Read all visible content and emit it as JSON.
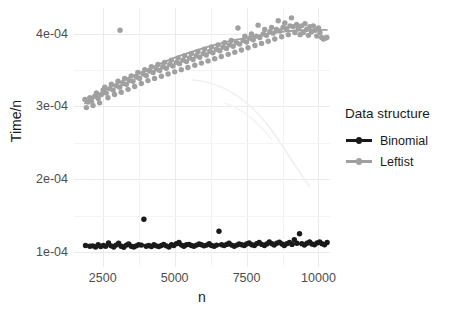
{
  "chart_data": {
    "type": "scatter",
    "title": "",
    "xlabel": "n",
    "ylabel": "Time/n",
    "xlim": [
      1500,
      10400
    ],
    "ylim": [
      8e-05,
      0.000435
    ],
    "grid": true,
    "legend_position": "right",
    "legend_title": "Data structure",
    "x_ticks": [
      {
        "value": 2500,
        "label": "2500"
      },
      {
        "value": 5000,
        "label": "5000"
      },
      {
        "value": 7500,
        "label": "7500"
      },
      {
        "value": 10000,
        "label": "10000"
      }
    ],
    "y_ticks": [
      {
        "value": 0.0001,
        "label": "1e-04"
      },
      {
        "value": 0.0002,
        "label": "2e-04"
      },
      {
        "value": 0.0003,
        "label": "3e-04"
      },
      {
        "value": 0.0004,
        "label": "4e-04"
      }
    ],
    "colors": {
      "binomial": "#1a1a1a",
      "leftist": "#a0a0a0",
      "grid": "#ebebeb",
      "panel": "#ffffff"
    },
    "series": [
      {
        "name": "Binomial",
        "color": "#1a1a1a",
        "points": [
          [
            1900,
            0.0001095
          ],
          [
            2050,
            0.0001085
          ],
          [
            2150,
            0.000109
          ],
          [
            2250,
            0.0001075
          ],
          [
            2340,
            0.0001105
          ],
          [
            2430,
            0.000108
          ],
          [
            2520,
            0.0001095
          ],
          [
            2600,
            0.0001085
          ],
          [
            2700,
            0.000113
          ],
          [
            2790,
            0.000109
          ],
          [
            2880,
            0.0001075
          ],
          [
            2960,
            0.00011
          ],
          [
            3050,
            0.0001125
          ],
          [
            3140,
            0.0001085
          ],
          [
            3230,
            0.000107
          ],
          [
            3320,
            0.00011
          ],
          [
            3400,
            0.0001115
          ],
          [
            3490,
            0.0001085
          ],
          [
            3580,
            0.0001075
          ],
          [
            3660,
            0.000109
          ],
          [
            3750,
            0.0001105
          ],
          [
            3840,
            0.00011
          ],
          [
            3930,
            0.0001455
          ],
          [
            4010,
            0.0001085
          ],
          [
            4100,
            0.0001095
          ],
          [
            4190,
            0.000108
          ],
          [
            4280,
            0.0001105
          ],
          [
            4360,
            0.000109
          ],
          [
            4450,
            0.000108
          ],
          [
            4540,
            0.0001095
          ],
          [
            4620,
            0.000111
          ],
          [
            4710,
            0.000109
          ],
          [
            4800,
            0.0001075
          ],
          [
            4890,
            0.0001105
          ],
          [
            4970,
            0.0001095
          ],
          [
            5060,
            0.000112
          ],
          [
            5150,
            0.0001135
          ],
          [
            5240,
            0.00011
          ],
          [
            5320,
            0.0001085
          ],
          [
            5410,
            0.0001105
          ],
          [
            5500,
            0.000111
          ],
          [
            5580,
            0.0001095
          ],
          [
            5670,
            0.0001085
          ],
          [
            5760,
            0.00011
          ],
          [
            5850,
            0.0001115
          ],
          [
            5930,
            0.0001105
          ],
          [
            6020,
            0.000109
          ],
          [
            6110,
            0.00011
          ],
          [
            6200,
            0.000112
          ],
          [
            6280,
            0.0001095
          ],
          [
            6370,
            0.0001085
          ],
          [
            6460,
            0.00011
          ],
          [
            6540,
            0.000129
          ],
          [
            6630,
            0.0001105
          ],
          [
            6720,
            0.0001095
          ],
          [
            6810,
            0.000111
          ],
          [
            6890,
            0.0001125
          ],
          [
            6980,
            0.00011
          ],
          [
            7070,
            0.0001085
          ],
          [
            7160,
            0.00011
          ],
          [
            7240,
            0.0001115
          ],
          [
            7330,
            0.0001105
          ],
          [
            7420,
            0.0001095
          ],
          [
            7500,
            0.0001115
          ],
          [
            7590,
            0.000113
          ],
          [
            7680,
            0.0001105
          ],
          [
            7770,
            0.0001095
          ],
          [
            7850,
            0.000112
          ],
          [
            7940,
            0.0001135
          ],
          [
            8030,
            0.000111
          ],
          [
            8120,
            0.0001095
          ],
          [
            8200,
            0.0001115
          ],
          [
            8290,
            0.0001145
          ],
          [
            8380,
            0.000112
          ],
          [
            8460,
            0.00011
          ],
          [
            8550,
            0.0001125
          ],
          [
            8640,
            0.000114
          ],
          [
            8730,
            0.0001115
          ],
          [
            8810,
            0.0001095
          ],
          [
            8900,
            0.000112
          ],
          [
            8990,
            0.0001135
          ],
          [
            9080,
            0.000111
          ],
          [
            9160,
            0.0001175
          ],
          [
            9250,
            0.0001125
          ],
          [
            9340,
            0.0001255
          ],
          [
            9420,
            0.000112
          ],
          [
            9510,
            0.00011
          ],
          [
            9600,
            0.0001125
          ],
          [
            9690,
            0.0001145
          ],
          [
            9770,
            0.0001115
          ],
          [
            9860,
            0.0001105
          ],
          [
            9950,
            0.000113
          ],
          [
            10040,
            0.0001145
          ],
          [
            10120,
            0.000112
          ],
          [
            10210,
            0.0001105
          ],
          [
            10300,
            0.0001135
          ]
        ],
        "trend": [
          [
            1900,
            0.0001092
          ],
          [
            3000,
            0.0001095
          ],
          [
            4000,
            0.0001096
          ],
          [
            5000,
            0.00011
          ],
          [
            6000,
            0.0001103
          ],
          [
            7000,
            0.0001107
          ],
          [
            8000,
            0.0001112
          ],
          [
            9000,
            0.0001118
          ],
          [
            10300,
            0.0001124
          ]
        ]
      },
      {
        "name": "Leftist",
        "color": "#a0a0a0",
        "points": [
          [
            1880,
            0.0003095
          ],
          [
            1930,
            0.0002985
          ],
          [
            1990,
            0.000306
          ],
          [
            2050,
            0.000312
          ],
          [
            2110,
            0.0003075
          ],
          [
            2160,
            0.0003015
          ],
          [
            2220,
            0.000314
          ],
          [
            2280,
            0.0003185
          ],
          [
            2340,
            0.000311
          ],
          [
            2390,
            0.000305
          ],
          [
            2450,
            0.0003165
          ],
          [
            2510,
            0.0003225
          ],
          [
            2570,
            0.0003265
          ],
          [
            2620,
            0.0003185
          ],
          [
            2680,
            0.000312
          ],
          [
            2740,
            0.0003245
          ],
          [
            2800,
            0.0003305
          ],
          [
            2860,
            0.0003225
          ],
          [
            2910,
            0.0003165
          ],
          [
            2970,
            0.0003285
          ],
          [
            3030,
            0.0003345
          ],
          [
            3090,
            0.0003265
          ],
          [
            3140,
            0.0003195
          ],
          [
            3200,
            0.0003315
          ],
          [
            3260,
            0.0003385
          ],
          [
            3320,
            0.0003305
          ],
          [
            3380,
            0.0003235
          ],
          [
            3430,
            0.0003355
          ],
          [
            3490,
            0.000342
          ],
          [
            3550,
            0.0003345
          ],
          [
            3610,
            0.0003275
          ],
          [
            3670,
            0.0003405
          ],
          [
            3720,
            0.0003465
          ],
          [
            3780,
            0.0003385
          ],
          [
            3840,
            0.0003315
          ],
          [
            3900,
            0.0003445
          ],
          [
            3960,
            0.0003505
          ],
          [
            4010,
            0.0003425
          ],
          [
            4070,
            0.0003355
          ],
          [
            4130,
            0.0003485
          ],
          [
            4190,
            0.0003545
          ],
          [
            4250,
            0.0003465
          ],
          [
            4300,
            0.0003385
          ],
          [
            4360,
            0.0003515
          ],
          [
            4420,
            0.0003575
          ],
          [
            4480,
            0.0003495
          ],
          [
            4540,
            0.0003415
          ],
          [
            4590,
            0.0003545
          ],
          [
            4650,
            0.0003605
          ],
          [
            4710,
            0.0003525
          ],
          [
            4770,
            0.0003445
          ],
          [
            4830,
            0.0003575
          ],
          [
            4880,
            0.0003635
          ],
          [
            4940,
            0.0003555
          ],
          [
            5000,
            0.0003475
          ],
          [
            5060,
            0.0003605
          ],
          [
            5120,
            0.0003665
          ],
          [
            5170,
            0.0003585
          ],
          [
            5230,
            0.0003505
          ],
          [
            5290,
            0.0003635
          ],
          [
            5350,
            0.0003695
          ],
          [
            5410,
            0.0003615
          ],
          [
            5460,
            0.0003535
          ],
          [
            5520,
            0.0003665
          ],
          [
            5580,
            0.0003725
          ],
          [
            5640,
            0.0003645
          ],
          [
            5700,
            0.0003565
          ],
          [
            5750,
            0.0003695
          ],
          [
            5810,
            0.0003755
          ],
          [
            5870,
            0.0003675
          ],
          [
            5930,
            0.0003595
          ],
          [
            5990,
            0.0003725
          ],
          [
            6040,
            0.0003785
          ],
          [
            6100,
            0.0003705
          ],
          [
            6160,
            0.0003625
          ],
          [
            6220,
            0.0003755
          ],
          [
            6280,
            0.0003815
          ],
          [
            6330,
            0.0003735
          ],
          [
            6390,
            0.0003655
          ],
          [
            6450,
            0.0003785
          ],
          [
            6510,
            0.0003845
          ],
          [
            6570,
            0.0003765
          ],
          [
            6620,
            0.0003685
          ],
          [
            6680,
            0.0003815
          ],
          [
            6740,
            0.0003875
          ],
          [
            6800,
            0.0003795
          ],
          [
            6860,
            0.0003715
          ],
          [
            6910,
            0.0003845
          ],
          [
            6970,
            0.0003905
          ],
          [
            7030,
            0.0003825
          ],
          [
            7090,
            0.0003745
          ],
          [
            7150,
            0.0003875
          ],
          [
            7200,
            0.0004075
          ],
          [
            7260,
            0.0003855
          ],
          [
            7320,
            0.0003775
          ],
          [
            7380,
            0.0003905
          ],
          [
            7440,
            0.0003965
          ],
          [
            7500,
            0.0003885
          ],
          [
            7550,
            0.0003805
          ],
          [
            7610,
            0.0003935
          ],
          [
            7670,
            0.0003995
          ],
          [
            7730,
            0.0003915
          ],
          [
            7790,
            0.0003835
          ],
          [
            7840,
            0.0003965
          ],
          [
            7900,
            0.0004115
          ],
          [
            7960,
            0.0003945
          ],
          [
            8020,
            0.0003865
          ],
          [
            8080,
            0.0003995
          ],
          [
            8130,
            0.0004055
          ],
          [
            8190,
            0.0003975
          ],
          [
            8250,
            0.0003895
          ],
          [
            8310,
            0.0004025
          ],
          [
            8370,
            0.0004085
          ],
          [
            8420,
            0.0004005
          ],
          [
            8480,
            0.0003925
          ],
          [
            8540,
            0.0004055
          ],
          [
            8600,
            0.0004175
          ],
          [
            8660,
            0.0004035
          ],
          [
            8720,
            0.0003955
          ],
          [
            8770,
            0.0004085
          ],
          [
            8830,
            0.0004145
          ],
          [
            8890,
            0.0004065
          ],
          [
            8950,
            0.0003985
          ],
          [
            9010,
            0.0004105
          ],
          [
            9060,
            0.0004215
          ],
          [
            9120,
            0.0004095
          ],
          [
            9180,
            0.0004015
          ],
          [
            9240,
            0.0004125
          ],
          [
            9300,
            0.0004065
          ],
          [
            9360,
            0.0003985
          ],
          [
            9410,
            0.0004105
          ],
          [
            9470,
            0.0004015
          ],
          [
            9530,
            0.0004135
          ],
          [
            9590,
            0.0004055
          ],
          [
            9650,
            0.0003975
          ],
          [
            9700,
            0.0004095
          ],
          [
            9760,
            0.0004025
          ],
          [
            9820,
            0.0004105
          ],
          [
            9880,
            0.0004045
          ],
          [
            9940,
            0.0003965
          ],
          [
            10000,
            0.0004075
          ],
          [
            10050,
            0.0004015
          ],
          [
            10110,
            0.0003945
          ],
          [
            10170,
            0.0003925
          ],
          [
            10230,
            0.0003935
          ],
          [
            10290,
            0.0003945
          ],
          [
            3100,
            0.0004045
          ]
        ],
        "trend": [
          [
            1880,
            0.000304
          ],
          [
            2200,
            0.0003125
          ],
          [
            2600,
            0.0003225
          ],
          [
            3000,
            0.0003315
          ],
          [
            3400,
            0.0003395
          ],
          [
            3800,
            0.0003465
          ],
          [
            4200,
            0.0003535
          ],
          [
            4600,
            0.0003605
          ],
          [
            5000,
            0.000367
          ],
          [
            5400,
            0.0003725
          ],
          [
            5800,
            0.0003775
          ],
          [
            6200,
            0.0003825
          ],
          [
            6600,
            0.0003865
          ],
          [
            7000,
            0.0003905
          ],
          [
            7400,
            0.0003935
          ],
          [
            7800,
            0.0003965
          ],
          [
            8200,
            0.0003995
          ],
          [
            8600,
            0.0004015
          ],
          [
            9000,
            0.0004035
          ],
          [
            9400,
            0.0004045
          ],
          [
            9800,
            0.000405
          ],
          [
            10290,
            0.000405
          ]
        ]
      }
    ],
    "annotations": []
  },
  "legend": {
    "title": "Data structure",
    "entries": [
      {
        "label": "Binomial",
        "color": "#1a1a1a"
      },
      {
        "label": "Leftist",
        "color": "#a0a0a0"
      }
    ]
  }
}
